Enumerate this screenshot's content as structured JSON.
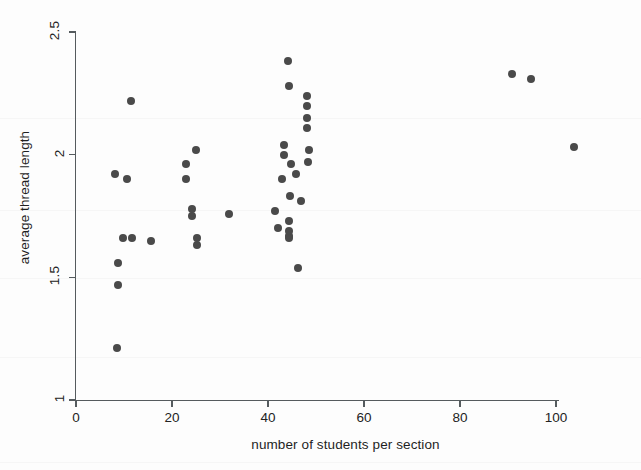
{
  "chart_data": {
    "type": "scatter",
    "title": "",
    "xlabel": "number of students per section",
    "ylabel": "average thread length",
    "xlim": [
      0,
      100
    ],
    "ylim": [
      1,
      2.5
    ],
    "xticks": [
      0,
      20,
      40,
      60,
      80,
      100
    ],
    "yticks": [
      1,
      1.5,
      2,
      2.5
    ],
    "xtick_labels": [
      "0",
      "20",
      "40",
      "60",
      "80",
      "100"
    ],
    "ytick_labels": [
      "1",
      "1.5",
      "2",
      "2.5"
    ],
    "grid": false,
    "legend": null,
    "marker": {
      "shape": "circle",
      "color": "#4a4a4a",
      "size_px": 8
    },
    "n_points": 42,
    "points": [
      {
        "x": 11.5,
        "y": 2.22
      },
      {
        "x": 8.1,
        "y": 1.92
      },
      {
        "x": 10.6,
        "y": 1.9
      },
      {
        "x": 9.8,
        "y": 1.66
      },
      {
        "x": 11.7,
        "y": 1.66
      },
      {
        "x": 15.6,
        "y": 1.65
      },
      {
        "x": 8.8,
        "y": 1.56
      },
      {
        "x": 8.8,
        "y": 1.47
      },
      {
        "x": 8.5,
        "y": 1.21
      },
      {
        "x": 25.0,
        "y": 2.02
      },
      {
        "x": 22.9,
        "y": 1.96
      },
      {
        "x": 22.9,
        "y": 1.9
      },
      {
        "x": 24.2,
        "y": 1.78
      },
      {
        "x": 24.2,
        "y": 1.75
      },
      {
        "x": 31.9,
        "y": 1.76
      },
      {
        "x": 25.2,
        "y": 1.66
      },
      {
        "x": 25.2,
        "y": 1.63
      },
      {
        "x": 44.2,
        "y": 2.38
      },
      {
        "x": 44.4,
        "y": 2.28
      },
      {
        "x": 48.1,
        "y": 2.24
      },
      {
        "x": 48.1,
        "y": 2.2
      },
      {
        "x": 48.1,
        "y": 2.15
      },
      {
        "x": 48.1,
        "y": 2.11
      },
      {
        "x": 43.3,
        "y": 2.04
      },
      {
        "x": 43.3,
        "y": 2.0
      },
      {
        "x": 44.8,
        "y": 1.96
      },
      {
        "x": 48.5,
        "y": 2.02
      },
      {
        "x": 48.3,
        "y": 1.97
      },
      {
        "x": 45.8,
        "y": 1.92
      },
      {
        "x": 42.9,
        "y": 1.9
      },
      {
        "x": 44.6,
        "y": 1.83
      },
      {
        "x": 46.9,
        "y": 1.81
      },
      {
        "x": 41.5,
        "y": 1.77
      },
      {
        "x": 44.4,
        "y": 1.73
      },
      {
        "x": 42.1,
        "y": 1.7
      },
      {
        "x": 44.4,
        "y": 1.67
      },
      {
        "x": 44.4,
        "y": 1.66
      },
      {
        "x": 44.4,
        "y": 1.69
      },
      {
        "x": 46.2,
        "y": 1.54
      },
      {
        "x": 90.8,
        "y": 2.33
      },
      {
        "x": 94.8,
        "y": 2.31
      },
      {
        "x": 103.8,
        "y": 2.03
      }
    ]
  },
  "axes": {
    "x_title": "number of students per section",
    "y_title": "average thread length"
  }
}
